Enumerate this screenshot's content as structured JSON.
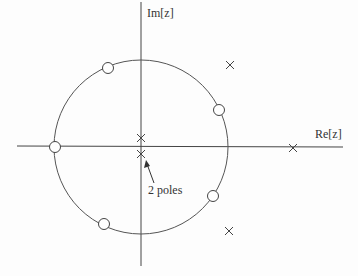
{
  "diagram": {
    "type": "pole-zero plot",
    "axes": {
      "imag_label": "Im[z]",
      "real_label": "Re[z]"
    },
    "unit_circle": {
      "present": true
    },
    "zeros": [
      {
        "angle_deg": 112,
        "label": "zero"
      },
      {
        "angle_deg": 30,
        "label": "zero"
      },
      {
        "angle_deg": 180,
        "label": "zero"
      },
      {
        "angle_deg": -40,
        "label": "zero"
      },
      {
        "angle_deg": -120,
        "label": "zero"
      }
    ],
    "poles": [
      {
        "position": "upper right outside circle"
      },
      {
        "position": "near origin, above real axis"
      },
      {
        "position": "near origin, below real axis"
      },
      {
        "position": "on real axis outside circle"
      },
      {
        "position": "lower right outside circle"
      }
    ],
    "annotation": {
      "text": "2 poles"
    },
    "colors": {
      "stroke": "#444444",
      "background": "#fdfdfd"
    }
  }
}
